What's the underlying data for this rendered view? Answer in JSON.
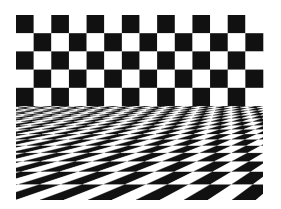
{
  "image": {
    "description": "Checkerboard optical illusion: flat checkered wall above a perspective checkered floor",
    "background": "#ffffff",
    "dark_color": "#111111",
    "light_color": "#ffffff"
  },
  "wall": {
    "x": 16,
    "y": 15,
    "width": 247,
    "rows": 5,
    "cols": 14,
    "row_height": 18.2,
    "first_black_col_row0": 0
  },
  "floor": {
    "top_y": 106,
    "bottom_y": 200,
    "left_x": 16,
    "right_x": 263,
    "rows": 16,
    "cols_visible": 11,
    "bottom_tile_width": 24,
    "horizon_y": 60,
    "vanish_x": 420,
    "first_white_bottom_left": true
  }
}
